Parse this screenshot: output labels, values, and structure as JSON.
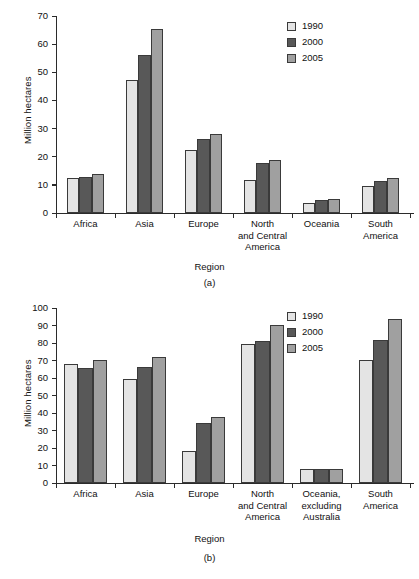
{
  "figure": {
    "panels": [
      {
        "tag": "(a)",
        "ylabel": "Million hectares",
        "xlabel": "Region"
      },
      {
        "tag": "(b)",
        "ylabel": "Million hectares",
        "xlabel": "Region"
      }
    ],
    "legend": {
      "entries": [
        {
          "label": "1990",
          "color": "#e4e4e4",
          "swatch": "legend-swatch-1990"
        },
        {
          "label": "2000",
          "color": "#585858",
          "swatch": "legend-swatch-2000"
        },
        {
          "label": "2005",
          "color": "#a0a0a0",
          "swatch": "legend-swatch-2005"
        }
      ]
    }
  },
  "chart_data": [
    {
      "type": "bar",
      "title": "(a)",
      "xlabel": "Region",
      "ylabel": "Million hectares",
      "ylim": [
        0,
        70
      ],
      "ytick_step": 10,
      "yticks": [
        0,
        10,
        20,
        30,
        40,
        50,
        60,
        70
      ],
      "grid": false,
      "legend_position": "top-right",
      "categories": [
        "Africa",
        "Asia",
        "Europe",
        "North\nand Central\nAmerica",
        "Oceania",
        "South\nAmerica"
      ],
      "category_lines": [
        [
          "Africa"
        ],
        [
          "Asia"
        ],
        [
          "Europe"
        ],
        [
          "North",
          "and Central",
          "America"
        ],
        [
          "Oceania"
        ],
        [
          "South",
          "America"
        ]
      ],
      "series": [
        {
          "name": "1990",
          "color": "#e4e4e4",
          "values": [
            12.4,
            47.3,
            22.4,
            11.7,
            3.5,
            9.7
          ]
        },
        {
          "name": "2000",
          "color": "#585858",
          "values": [
            12.8,
            56.3,
            26.2,
            17.9,
            4.6,
            11.5
          ]
        },
        {
          "name": "2005",
          "color": "#a0a0a0",
          "values": [
            13.9,
            65.3,
            28.2,
            18.7,
            5.0,
            12.4
          ]
        }
      ]
    },
    {
      "type": "bar",
      "title": "(b)",
      "xlabel": "Region",
      "ylabel": "Million hectares",
      "ylim": [
        0,
        100
      ],
      "ytick_step": 10,
      "yticks": [
        0,
        10,
        20,
        30,
        40,
        50,
        60,
        70,
        80,
        90,
        100
      ],
      "grid": false,
      "legend_position": "top-right",
      "categories": [
        "Africa",
        "Asia",
        "Europe",
        "North\nand Central\nAmerica",
        "Oceania,\nexcluding\nAustralia",
        "South\nAmerica"
      ],
      "category_lines": [
        [
          "Africa"
        ],
        [
          "Asia"
        ],
        [
          "Europe"
        ],
        [
          "North",
          "and Central",
          "America"
        ],
        [
          "Oceania,",
          "excluding",
          "Australia"
        ],
        [
          "South",
          "America"
        ]
      ],
      "series": [
        {
          "name": "1990",
          "color": "#e4e4e4",
          "values": [
            68.0,
            59.3,
            18.5,
            79.5,
            7.8,
            70.5
          ]
        },
        {
          "name": "2000",
          "color": "#585858",
          "values": [
            66.0,
            66.5,
            34.2,
            81.0,
            8.0,
            82.0
          ]
        },
        {
          "name": "2005",
          "color": "#a0a0a0",
          "values": [
            70.5,
            72.2,
            37.7,
            90.3,
            8.2,
            93.6
          ]
        }
      ]
    }
  ]
}
